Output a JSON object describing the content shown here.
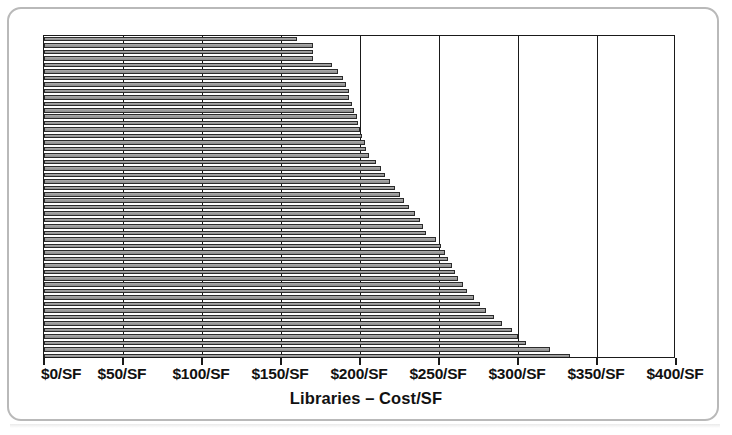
{
  "figure": {
    "axis_title": "Libraries – Cost/SF",
    "bar_fill_color": "#9d9d9d",
    "bar_outline_color": "#2b2b2b",
    "gridline_color": "#1a1a1a",
    "card_border_color": "#b9b9b9",
    "background_color": "#ffffff"
  },
  "chart_data": {
    "type": "bar",
    "orientation": "horizontal",
    "title": "",
    "subtitle": "",
    "xlabel": "Libraries – Cost/SF",
    "ylabel": "",
    "xlim": [
      0,
      400
    ],
    "ylim": [
      0,
      50
    ],
    "grid": true,
    "legend": false,
    "legend_position": "none",
    "sorted": "ascending-top-to-bottom",
    "tick_labels": [
      "$0/SF",
      "$50/SF",
      "$100/SF",
      "$150/SF",
      "$200/SF",
      "$250/SF",
      "$300/SF",
      "$350/SF",
      "$400/SF"
    ],
    "tick_values": [
      0,
      50,
      100,
      150,
      200,
      250,
      300,
      350,
      400
    ],
    "categories": [
      "Library 1",
      "Library 2",
      "Library 3",
      "Library 4",
      "Library 5",
      "Library 6",
      "Library 7",
      "Library 8",
      "Library 9",
      "Library 10",
      "Library 11",
      "Library 12",
      "Library 13",
      "Library 14",
      "Library 15",
      "Library 16",
      "Library 17",
      "Library 18",
      "Library 19",
      "Library 20",
      "Library 21",
      "Library 22",
      "Library 23",
      "Library 24",
      "Library 25",
      "Library 26",
      "Library 27",
      "Library 28",
      "Library 29",
      "Library 30",
      "Library 31",
      "Library 32",
      "Library 33",
      "Library 34",
      "Library 35",
      "Library 36",
      "Library 37",
      "Library 38",
      "Library 39",
      "Library 40",
      "Library 41",
      "Library 42",
      "Library 43",
      "Library 44",
      "Library 45",
      "Library 46",
      "Library 47",
      "Library 48",
      "Library 49",
      "Library 50"
    ],
    "values": [
      160,
      170,
      170,
      170,
      182,
      186,
      189,
      191,
      193,
      193,
      195,
      196,
      198,
      199,
      200,
      201,
      203,
      204,
      206,
      210,
      213,
      216,
      219,
      222,
      225,
      228,
      231,
      235,
      238,
      240,
      242,
      248,
      251,
      254,
      256,
      258,
      260,
      262,
      265,
      268,
      272,
      276,
      280,
      285,
      290,
      296,
      300,
      305,
      320,
      333
    ],
    "units": "$/SF",
    "n_bars": 50
  }
}
